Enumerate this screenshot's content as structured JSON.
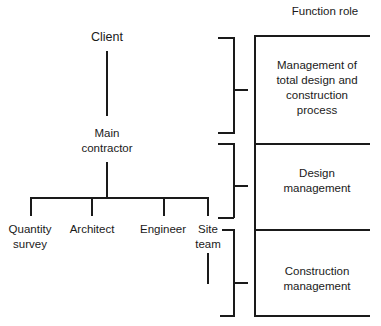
{
  "header": {
    "function_role_label": "Function role"
  },
  "org_tree": {
    "root": "Client",
    "main": [
      "Main",
      "contractor"
    ],
    "children": [
      {
        "id": "quantity-survey",
        "lines": [
          "Quantity",
          "survey"
        ]
      },
      {
        "id": "architect",
        "lines": [
          "Architect"
        ]
      },
      {
        "id": "engineer",
        "lines": [
          "Engineer"
        ]
      },
      {
        "id": "site-team",
        "lines": [
          "Site",
          "team"
        ]
      }
    ]
  },
  "function_roles": [
    {
      "id": "total-management",
      "lines": [
        "Management of",
        "total design and",
        "construction",
        "process"
      ],
      "maps_to": "Client + Main contractor"
    },
    {
      "id": "design-management",
      "lines": [
        "Design",
        "management"
      ],
      "maps_to": "Main contractor + consultants"
    },
    {
      "id": "construction-management",
      "lines": [
        "Construction",
        "management"
      ],
      "maps_to": "Site team"
    }
  ],
  "colors": {
    "line": "#1a1a1a",
    "background": "#ffffff"
  }
}
